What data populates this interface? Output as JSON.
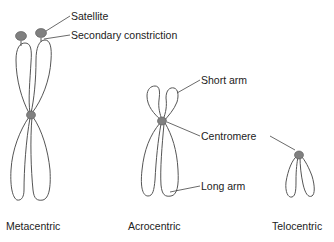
{
  "diagram": {
    "colors": {
      "outline": "#555555",
      "centromere": "#808080",
      "leader": "#444444",
      "text": "#222222"
    },
    "chromosomes": [
      {
        "type": "Metacentric",
        "caption": "Metacentric"
      },
      {
        "type": "Acrocentric",
        "caption": "Acrocentric"
      },
      {
        "type": "Telocentric",
        "caption": "Telocentric"
      }
    ],
    "labels": {
      "satellite": "Satellite",
      "secondary_constriction": "Secondary constriction",
      "short_arm": "Short arm",
      "centromere": "Centromere",
      "long_arm": "Long arm"
    }
  }
}
